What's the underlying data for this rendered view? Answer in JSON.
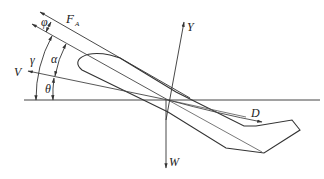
{
  "diagram": {
    "labels": {
      "phi": "φ",
      "fa": "F",
      "fa_sub": "A",
      "gamma": "γ",
      "alpha": "α",
      "v": "V",
      "theta": "θ",
      "y": "Y",
      "d": "D",
      "w": "W"
    },
    "colors": {
      "stroke": "#333333",
      "text": "#222222",
      "background": "#ffffff"
    }
  }
}
